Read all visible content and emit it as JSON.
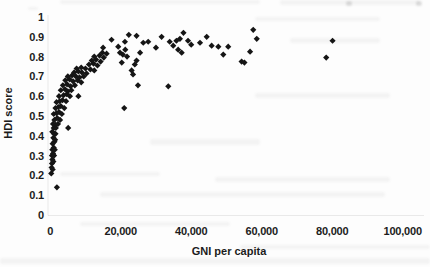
{
  "chart_data": {
    "type": "scatter",
    "title": "",
    "xlabel": "GNI per capita",
    "ylabel": "HDI score",
    "xlim": [
      0,
      100000
    ],
    "ylim": [
      0,
      1
    ],
    "grid": false,
    "legend_position": "none",
    "marker": "diamond",
    "marker_color": "#151515",
    "x_ticks": [
      0,
      20000,
      40000,
      60000,
      80000,
      100000
    ],
    "x_tick_labels": [
      "0",
      "20,000",
      "40,000",
      "60,000",
      "80,000",
      "100,000"
    ],
    "y_ticks": [
      0,
      0.1,
      0.2,
      0.3,
      0.4,
      0.5,
      0.6,
      0.7,
      0.8,
      0.9,
      1
    ],
    "y_tick_labels": [
      "0",
      "0.1",
      "0.2",
      "0.3",
      "0.4",
      "0.5",
      "0.6",
      "0.7",
      "0.8",
      "0.9",
      "1"
    ],
    "points": [
      [
        300,
        0.21
      ],
      [
        400,
        0.24
      ],
      [
        500,
        0.26
      ],
      [
        700,
        0.23
      ],
      [
        600,
        0.28
      ],
      [
        900,
        0.27
      ],
      [
        500,
        0.3
      ],
      [
        800,
        0.31
      ],
      [
        1100,
        0.3
      ],
      [
        600,
        0.33
      ],
      [
        1000,
        0.34
      ],
      [
        1300,
        0.33
      ],
      [
        700,
        0.36
      ],
      [
        1200,
        0.37
      ],
      [
        900,
        0.39
      ],
      [
        1400,
        0.38
      ],
      [
        1100,
        0.41
      ],
      [
        600,
        0.42
      ],
      [
        1500,
        0.41
      ],
      [
        1000,
        0.44
      ],
      [
        1600,
        0.44
      ],
      [
        1900,
        0.14
      ],
      [
        800,
        0.46
      ],
      [
        1500,
        0.455
      ],
      [
        2200,
        0.46
      ],
      [
        1200,
        0.48
      ],
      [
        2000,
        0.49
      ],
      [
        2800,
        0.48
      ],
      [
        1000,
        0.51
      ],
      [
        1800,
        0.515
      ],
      [
        2500,
        0.52
      ],
      [
        3300,
        0.51
      ],
      [
        1500,
        0.54
      ],
      [
        2300,
        0.545
      ],
      [
        3000,
        0.55
      ],
      [
        4000,
        0.54
      ],
      [
        1800,
        0.57
      ],
      [
        2700,
        0.575
      ],
      [
        3500,
        0.58
      ],
      [
        4500,
        0.575
      ],
      [
        2500,
        0.6
      ],
      [
        3800,
        0.605
      ],
      [
        4700,
        0.61
      ],
      [
        5600,
        0.6
      ],
      [
        3000,
        0.63
      ],
      [
        4200,
        0.635
      ],
      [
        5000,
        0.625
      ],
      [
        6000,
        0.63
      ],
      [
        3600,
        0.655
      ],
      [
        4800,
        0.66
      ],
      [
        5800,
        0.65
      ],
      [
        7000,
        0.655
      ],
      [
        4300,
        0.68
      ],
      [
        5500,
        0.685
      ],
      [
        6500,
        0.675
      ],
      [
        7800,
        0.68
      ],
      [
        8800,
        0.67
      ],
      [
        5000,
        0.7
      ],
      [
        6200,
        0.705
      ],
      [
        7300,
        0.7
      ],
      [
        8300,
        0.695
      ],
      [
        9500,
        0.7
      ],
      [
        6800,
        0.72
      ],
      [
        8000,
        0.725
      ],
      [
        9000,
        0.72
      ],
      [
        10300,
        0.715
      ],
      [
        7500,
        0.74
      ],
      [
        8800,
        0.745
      ],
      [
        10000,
        0.74
      ],
      [
        11400,
        0.735
      ],
      [
        12500,
        0.73
      ],
      [
        5100,
        0.44
      ],
      [
        8000,
        0.6
      ],
      [
        11000,
        0.76
      ],
      [
        12300,
        0.765
      ],
      [
        13400,
        0.755
      ],
      [
        11800,
        0.78
      ],
      [
        13000,
        0.785
      ],
      [
        14300,
        0.775
      ],
      [
        12500,
        0.8
      ],
      [
        14000,
        0.805
      ],
      [
        15200,
        0.795
      ],
      [
        14800,
        0.82
      ],
      [
        16000,
        0.815
      ],
      [
        15000,
        0.845
      ],
      [
        17400,
        0.885
      ],
      [
        19300,
        0.85
      ],
      [
        19800,
        0.82
      ],
      [
        20600,
        0.81
      ],
      [
        21300,
        0.835
      ],
      [
        21800,
        0.8
      ],
      [
        20300,
        0.77
      ],
      [
        21200,
        0.875
      ],
      [
        22300,
        0.91
      ],
      [
        23100,
        0.73
      ],
      [
        23500,
        0.71
      ],
      [
        24000,
        0.76
      ],
      [
        24500,
        0.78
      ],
      [
        25500,
        0.82
      ],
      [
        26400,
        0.87
      ],
      [
        27800,
        0.875
      ],
      [
        24500,
        0.905
      ],
      [
        21000,
        0.54
      ],
      [
        24900,
        0.655
      ],
      [
        33500,
        0.65
      ],
      [
        30000,
        0.845
      ],
      [
        31600,
        0.9
      ],
      [
        33900,
        0.875
      ],
      [
        34900,
        0.855
      ],
      [
        35800,
        0.88
      ],
      [
        36800,
        0.89
      ],
      [
        37800,
        0.92
      ],
      [
        39100,
        0.88
      ],
      [
        36300,
        0.835
      ],
      [
        37300,
        0.82
      ],
      [
        40000,
        0.86
      ],
      [
        42500,
        0.87
      ],
      [
        44400,
        0.9
      ],
      [
        45800,
        0.855
      ],
      [
        47700,
        0.85
      ],
      [
        49100,
        0.81
      ],
      [
        50500,
        0.85
      ],
      [
        54300,
        0.775
      ],
      [
        55100,
        0.77
      ],
      [
        56700,
        0.825
      ],
      [
        57600,
        0.935
      ],
      [
        58600,
        0.89
      ],
      [
        78300,
        0.795
      ],
      [
        80100,
        0.88
      ]
    ]
  },
  "colors": {
    "background": "#fdfdfd",
    "text": "#1c1c1c",
    "marker": "#151515",
    "axis_line": "rgba(0,0,0,0.08)"
  }
}
